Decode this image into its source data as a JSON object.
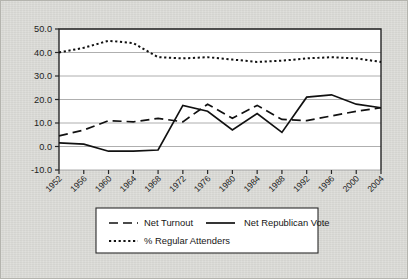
{
  "chart_data": {
    "type": "line",
    "title": "",
    "xlabel": "",
    "ylabel": "",
    "ylim": [
      -10.0,
      50.0
    ],
    "ytick_step": 10.0,
    "grid": "horizontal",
    "legend_position": "bottom",
    "categories": [
      "1952",
      "1956",
      "1960",
      "1964",
      "1968",
      "1972",
      "1976",
      "1980",
      "1984",
      "1988",
      "1992",
      "1996",
      "2000",
      "2004"
    ],
    "ytick_labels": [
      "50.0",
      "40.0",
      "30.0",
      "20.0",
      "10.0",
      "0.0",
      "-10.0"
    ],
    "ytick_values": [
      50.0,
      40.0,
      30.0,
      20.0,
      10.0,
      0.0,
      -10.0
    ],
    "series": [
      {
        "name": "Net Turnout",
        "style": "dashed",
        "color": "#111111",
        "values": [
          4.5,
          7.0,
          11.0,
          10.5,
          12.0,
          10.5,
          18.0,
          12.0,
          17.5,
          11.5,
          11.0,
          13.0,
          15.0,
          16.5
        ]
      },
      {
        "name": "Net Republican Vote",
        "style": "solid",
        "color": "#111111",
        "values": [
          1.5,
          1.0,
          -2.0,
          -2.0,
          -1.5,
          17.5,
          15.0,
          7.0,
          14.0,
          6.0,
          21.0,
          22.0,
          18.0,
          16.5
        ]
      },
      {
        "name": "% Regular Attenders",
        "style": "dotted",
        "color": "#111111",
        "values": [
          40.0,
          42.0,
          45.0,
          44.0,
          38.0,
          37.5,
          38.0,
          37.0,
          36.0,
          36.5,
          37.5,
          38.0,
          37.5,
          36.0
        ]
      }
    ]
  },
  "legend": {
    "entries": [
      {
        "label": "Net Turnout",
        "style": "dashed"
      },
      {
        "label": "Net Republican Vote",
        "style": "solid"
      },
      {
        "label": "% Regular Attenders",
        "style": "dotted"
      }
    ]
  },
  "colors": {
    "page_background": "#d9d9d5",
    "plot_background": "#ffffff",
    "gridline": "#9a9a9a",
    "axis": "#262626",
    "ink": "#111111"
  }
}
